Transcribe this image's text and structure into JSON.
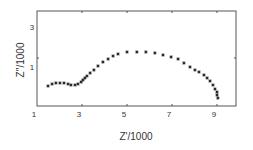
{
  "chart_data": {
    "type": "scatter",
    "title": "",
    "xlabel": "Z'/1000",
    "ylabel": "Z''/1000",
    "xlim": [
      1,
      9.8
    ],
    "ylim": [
      -1,
      3.8
    ],
    "xticks": [
      1,
      3,
      5,
      7,
      9
    ],
    "yticks": [
      1,
      3
    ],
    "grid": false,
    "legend": null,
    "marker": "asterisk",
    "marker_color": "#222222",
    "series": [
      {
        "name": "impedance",
        "points": [
          [
            1.49,
            0.05
          ],
          [
            1.67,
            0.15
          ],
          [
            1.84,
            0.2
          ],
          [
            2.02,
            0.2
          ],
          [
            2.2,
            0.2
          ],
          [
            2.38,
            0.15
          ],
          [
            2.51,
            0.1
          ],
          [
            2.69,
            0.1
          ],
          [
            2.82,
            0.15
          ],
          [
            2.96,
            0.25
          ],
          [
            3.04,
            0.35
          ],
          [
            3.13,
            0.45
          ],
          [
            3.22,
            0.55
          ],
          [
            3.36,
            0.7
          ],
          [
            3.53,
            0.85
          ],
          [
            3.71,
            1.05
          ],
          [
            3.93,
            1.25
          ],
          [
            4.16,
            1.4
          ],
          [
            4.38,
            1.55
          ],
          [
            4.6,
            1.65
          ],
          [
            5.0,
            1.75
          ],
          [
            5.44,
            1.75
          ],
          [
            5.84,
            1.75
          ],
          [
            6.24,
            1.7
          ],
          [
            6.6,
            1.6
          ],
          [
            6.96,
            1.5
          ],
          [
            7.27,
            1.4
          ],
          [
            7.53,
            1.2
          ],
          [
            7.8,
            1.0
          ],
          [
            8.02,
            0.85
          ],
          [
            8.2,
            0.75
          ],
          [
            8.42,
            0.6
          ],
          [
            8.56,
            0.45
          ],
          [
            8.69,
            0.3
          ],
          [
            8.82,
            0.1
          ],
          [
            8.91,
            -0.1
          ],
          [
            9.0,
            -0.25
          ],
          [
            9.0,
            -0.4
          ],
          [
            9.04,
            -0.55
          ]
        ]
      }
    ]
  },
  "layout": {
    "plot_left": 37,
    "plot_top": 11,
    "plot_right": 236,
    "plot_bottom": 106,
    "x_px_per_unit": 22.5,
    "y_px_per_unit": 20,
    "x_origin_value": 1,
    "y_ref_value": 1,
    "y_ref_px": 67
  },
  "axes": {
    "x_tick_positions_px": [
      37,
      82,
      127,
      172,
      217
    ],
    "x_tick_labels": [
      "1",
      "3",
      "5",
      "7",
      "9"
    ],
    "y_tick_labels": [
      "3",
      "1"
    ],
    "y_tick_label_positions_px": [
      27,
      67
    ],
    "y_tick_marks_px": [
      58
    ]
  }
}
